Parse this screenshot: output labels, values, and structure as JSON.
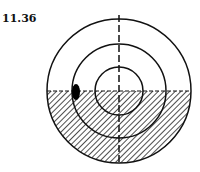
{
  "figure": {
    "label": "11.36",
    "colors": {
      "stroke": "#111111",
      "hatch": "#222222",
      "background": "#ffffff"
    }
  }
}
